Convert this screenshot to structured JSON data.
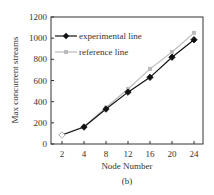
{
  "chart_data": {
    "type": "line",
    "title": "",
    "caption": "(b)",
    "xlabel": "Node Number",
    "ylabel": "Max concurrent streams",
    "x": [
      2,
      4,
      8,
      12,
      16,
      20,
      24
    ],
    "x_tick_labels": [
      "2",
      "4",
      "8",
      "12",
      "16",
      "20",
      "24"
    ],
    "y_tick_labels": [
      "0",
      "200",
      "400",
      "600",
      "800",
      "1000",
      "1200"
    ],
    "ylim": [
      0,
      1200
    ],
    "grid": false,
    "legend_position": "upper left",
    "series": [
      {
        "name": "experimental line",
        "color": "#111111",
        "marker": "diamond",
        "values": [
          85,
          160,
          330,
          490,
          630,
          820,
          985
        ]
      },
      {
        "name": "reference line",
        "color": "#bbbbbb",
        "marker": "square",
        "values": [
          85,
          165,
          345,
          520,
          710,
          870,
          1050
        ]
      }
    ]
  }
}
